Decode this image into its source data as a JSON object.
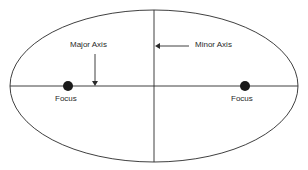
{
  "diagram": {
    "labels": {
      "major_axis": "Major Axis",
      "minor_axis": "Minor Axis",
      "focus_left": "Focus",
      "focus_right": "Focus"
    },
    "colors": {
      "stroke": "#2a2a2a",
      "focus_fill": "#1a1a1a",
      "background": "#ffffff"
    },
    "geometry": {
      "ellipse": {
        "cx": 154,
        "cy": 86,
        "rx": 144,
        "ry": 76
      },
      "foci": [
        {
          "x": 68,
          "y": 86,
          "r": 5
        },
        {
          "x": 245,
          "y": 86,
          "r": 5
        }
      ]
    }
  }
}
